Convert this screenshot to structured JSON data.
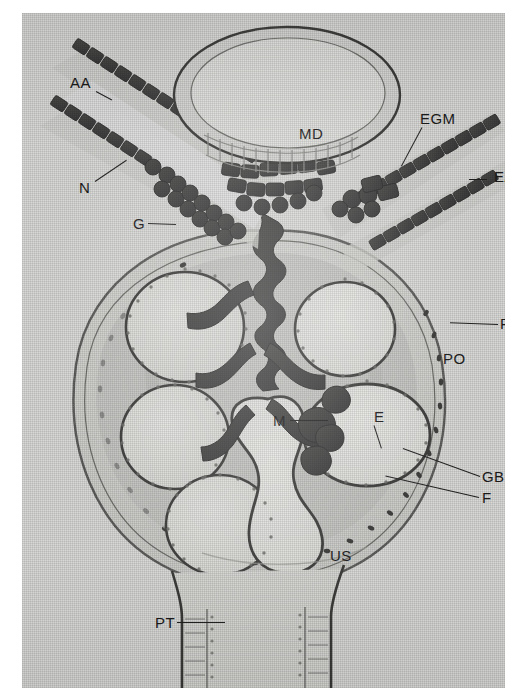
{
  "figure": {
    "kind": "histology-diagram",
    "background_color": "#ffffff",
    "plate_color": "#d8d8d6",
    "ink_color": "#2b2b2b",
    "label_color": "#1b1b1b"
  },
  "labels": {
    "aa": "AA",
    "n": "N",
    "g": "G",
    "md": "MD",
    "egm": "EGM",
    "ea": "EA",
    "pe": "PE",
    "po": "PO",
    "m": "M",
    "e": "E",
    "gbm": "GBM",
    "f": "F",
    "us": "US",
    "pt": "PT"
  },
  "label_meanings": {
    "AA": "afferent arteriole",
    "N": "nerve",
    "G": "granular (juxtaglomerular) cells",
    "MD": "macula densa",
    "EGM": "extraglomerular mesangium",
    "EA": "efferent arteriole",
    "PE": "parietal epithelium",
    "PO": "podocyte",
    "M": "mesangial cell",
    "E": "endothelium",
    "GBM": "glomerular basement membrane",
    "F": "foot processes",
    "US": "urinary space",
    "PT": "proximal tubule"
  },
  "label_positions": [
    {
      "key": "aa",
      "x": 48,
      "y": 62,
      "leader": {
        "x": 74,
        "y": 78,
        "len": 18,
        "angle": 28
      }
    },
    {
      "key": "n",
      "x": 57,
      "y": 167,
      "leader": {
        "x": 73,
        "y": 168,
        "len": 38,
        "angle": -34
      }
    },
    {
      "key": "g",
      "x": 111,
      "y": 203,
      "leader": {
        "x": 126,
        "y": 210,
        "len": 28,
        "angle": 2
      }
    },
    {
      "key": "md",
      "x": 277,
      "y": 113,
      "leader": null
    },
    {
      "key": "egm",
      "x": 398,
      "y": 98,
      "leader": {
        "x": 400,
        "y": 114,
        "len": 44,
        "angle": 118
      }
    },
    {
      "key": "ea",
      "x": 472,
      "y": 156,
      "leader": {
        "x": 447,
        "y": 166,
        "len": 18,
        "angle": 0
      }
    },
    {
      "key": "pe",
      "x": 478,
      "y": 303,
      "leader": {
        "x": 476,
        "y": 311,
        "len": 48,
        "angle": 182
      }
    },
    {
      "key": "po",
      "x": 421,
      "y": 338,
      "leader": null
    },
    {
      "key": "m",
      "x": 251,
      "y": 400,
      "leader": {
        "x": 268,
        "y": 407,
        "len": 38,
        "angle": 0
      }
    },
    {
      "key": "e",
      "x": 352,
      "y": 396,
      "leader": {
        "x": 352,
        "y": 412,
        "len": 24,
        "angle": 72
      }
    },
    {
      "key": "gbm",
      "x": 460,
      "y": 456,
      "leader": {
        "x": 458,
        "y": 463,
        "len": 82,
        "angle": 200
      }
    },
    {
      "key": "f",
      "x": 460,
      "y": 477,
      "leader": {
        "x": 457,
        "y": 484,
        "len": 96,
        "angle": 193
      }
    },
    {
      "key": "us",
      "x": 308,
      "y": 535,
      "leader": null
    },
    {
      "key": "pt",
      "x": 133,
      "y": 602,
      "leader": {
        "x": 155,
        "y": 609,
        "len": 48,
        "angle": 0
      }
    }
  ],
  "structures": {
    "bowmans_capsule": "large round capsule occupying the lower two-thirds of the plate",
    "capillary_loops_count": 7,
    "arterioles": [
      "afferent arteriole (upper left)",
      "efferent arteriole (upper right)"
    ],
    "macula_densa": "oval tubule profile at the top centre",
    "proximal_tubule": "vertical tubule descending from the capsule at the bottom"
  }
}
